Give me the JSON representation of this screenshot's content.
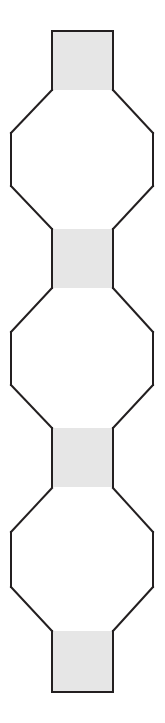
{
  "figure": {
    "canvas": {
      "width": 165,
      "height": 723
    },
    "style": {
      "background_color": "#ffffff",
      "stroke_color": "#231f20",
      "stroke_width": 2,
      "shaded_fill": "#e6e6e6",
      "unshaded_fill": "#ffffff",
      "junction_stroke": "none"
    },
    "geometry": {
      "center_x": 82,
      "neck_left_x": 52,
      "neck_right_x": 113,
      "neck_width": 61,
      "octagon_left_x": 11,
      "octagon_right_x": 153,
      "octagon_width": 142,
      "vertical_period": 200
    },
    "shapes": [
      {
        "id": "cap-top",
        "name": "top-cap-rectangle",
        "type": "rectangle",
        "shaded": true,
        "x": 52,
        "y": 31,
        "width": 61,
        "height": 59,
        "open_edges": [
          "bottom"
        ]
      },
      {
        "id": "octagon-1",
        "name": "octagon-upper",
        "type": "octagon",
        "shaded": false,
        "top_y": 90,
        "bottom_y": 229,
        "flat_top_left_x": 52,
        "flat_top_right_x": 113,
        "side_top_y": 133,
        "side_bottom_y": 186,
        "left_x": 11,
        "right_x": 153,
        "open_edges": [
          "top",
          "bottom"
        ]
      },
      {
        "id": "neck-1",
        "name": "neck-rectangle-upper",
        "type": "rectangle",
        "shaded": true,
        "x": 52,
        "y": 229,
        "width": 61,
        "height": 59,
        "open_edges": [
          "top",
          "bottom"
        ]
      },
      {
        "id": "octagon-2",
        "name": "octagon-middle",
        "type": "octagon",
        "shaded": false,
        "top_y": 288,
        "bottom_y": 428,
        "flat_top_left_x": 52,
        "flat_top_right_x": 113,
        "side_top_y": 332,
        "side_bottom_y": 385,
        "left_x": 11,
        "right_x": 153,
        "open_edges": [
          "top",
          "bottom"
        ]
      },
      {
        "id": "neck-2",
        "name": "neck-rectangle-lower",
        "type": "rectangle",
        "shaded": true,
        "x": 52,
        "y": 428,
        "width": 61,
        "height": 59,
        "open_edges": [
          "top",
          "bottom"
        ]
      },
      {
        "id": "octagon-3",
        "name": "octagon-lower",
        "type": "octagon",
        "shaded": false,
        "top_y": 488,
        "bottom_y": 631,
        "flat_top_left_x": 52,
        "flat_top_right_x": 113,
        "side_top_y": 532,
        "side_bottom_y": 587,
        "left_x": 11,
        "right_x": 153,
        "open_edges": [
          "top",
          "bottom"
        ]
      },
      {
        "id": "cap-bottom",
        "name": "bottom-cap-rectangle",
        "type": "rectangle",
        "shaded": true,
        "x": 52,
        "y": 631,
        "width": 61,
        "height": 61,
        "open_edges": [
          "top"
        ]
      }
    ]
  }
}
